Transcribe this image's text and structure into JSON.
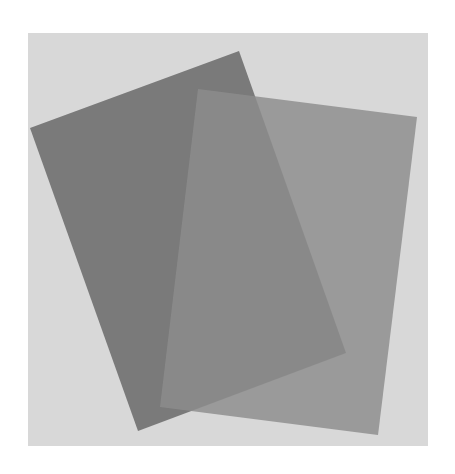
{
  "scene": {
    "description": "Two overlapping semi-transparent gray sheets on a light gray backdrop",
    "canvas_color": "#ffffff",
    "backdrop": {
      "color": "#d8d8d8",
      "x": 28,
      "y": 33,
      "width": 400,
      "height": 413
    },
    "sheets": [
      {
        "name": "dark-sheet-back",
        "color": "#7a7a7a",
        "opacity": 1,
        "points": "30,128 239,51 346,353 138,431"
      },
      {
        "name": "light-sheet-front",
        "color": "#8d8d8d",
        "opacity": 0.83,
        "points": "198,89 417,117 378,435 160,407"
      }
    ]
  }
}
